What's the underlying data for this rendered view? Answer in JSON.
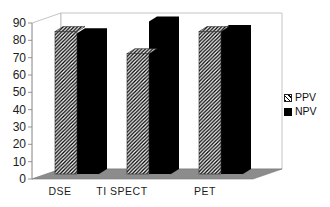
{
  "chart_data": {
    "type": "bar",
    "projection": "3d",
    "title": "",
    "categories": [
      "DSE",
      "TI SPECT",
      "PET"
    ],
    "series": [
      {
        "name": "PPV",
        "fill": "diagonal-hatch",
        "stripe_color": "#000000",
        "bg_color": "#ffffff",
        "values": [
          84,
          71,
          84
        ]
      },
      {
        "name": "NPV",
        "fill": "solid",
        "color": "#000000",
        "values": [
          83,
          90,
          85
        ]
      }
    ],
    "ylim": [
      0,
      90
    ],
    "yticks": [
      0,
      10,
      20,
      30,
      40,
      50,
      60,
      70,
      80,
      90
    ],
    "xlabel": "",
    "ylabel": "",
    "grid": false,
    "legend_position": "middle-right",
    "colors": {
      "floor": "#8c8c8c",
      "floor_border": "#7a7a7a",
      "wall": "#ffffff",
      "wall_border": "#b5b5b5",
      "axis_text": "#1c1c1c"
    }
  }
}
